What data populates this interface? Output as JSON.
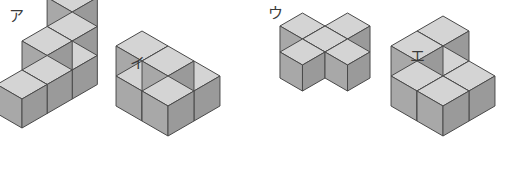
{
  "page": {
    "background_color": "#ffffff",
    "width": 515,
    "height": 184
  },
  "style": {
    "cube_top_color": "#d4d4d4",
    "cube_left_color": "#a8a8a8",
    "cube_right_color": "#9a9a9a",
    "cube_outline_color": "#4a4a4a",
    "label_color": "#3a3a3a"
  },
  "figures": [
    {
      "id": "figure-a",
      "label": "ア",
      "label_name": "figure-label-a",
      "description": "staircase of six cubes: three-high column at back, two-high in middle, one at front",
      "cube_size": 29,
      "origin_x": 22,
      "origin_y": 128,
      "cube_count": 6,
      "cubes": [
        {
          "x": 0,
          "y": 0,
          "z": 0
        },
        {
          "x": 1,
          "y": 0,
          "z": 0
        },
        {
          "x": 2,
          "y": 0,
          "z": 0
        },
        {
          "x": 1,
          "y": 0,
          "z": 1
        },
        {
          "x": 2,
          "y": 0,
          "z": 1
        },
        {
          "x": 2,
          "y": 0,
          "z": 2
        }
      ]
    },
    {
      "id": "figure-i",
      "label": "イ",
      "label_name": "figure-label-i",
      "description": "L-shaped arrangement of four cubes: two-by-one base with one cube stacked at back-left",
      "cube_size": 30,
      "origin_x": 168,
      "origin_y": 136,
      "cube_count": 4,
      "cubes": [
        {
          "x": 0,
          "y": 0,
          "z": 0
        },
        {
          "x": 0,
          "y": 1,
          "z": 0
        },
        {
          "x": 1,
          "y": 0,
          "z": 0
        },
        {
          "x": 0,
          "y": 1,
          "z": 1
        },
        {
          "x": 0,
          "y": 0,
          "z": 1
        }
      ]
    },
    {
      "id": "figure-u",
      "label": "ウ",
      "label_name": "figure-label-u",
      "description": "plus / cross shape of five cubes on one level, one center cube with four neighbours",
      "cube_size": 26,
      "origin_x": 325,
      "origin_y": 78,
      "cube_count": 5,
      "cubes": [
        {
          "x": 0,
          "y": 0,
          "z": 0
        },
        {
          "x": 1,
          "y": 0,
          "z": 0
        },
        {
          "x": -1,
          "y": 0,
          "z": 0
        },
        {
          "x": 0,
          "y": 1,
          "z": 0
        },
        {
          "x": 0,
          "y": -1,
          "z": 0
        }
      ]
    },
    {
      "id": "figure-e",
      "label": "エ",
      "label_name": "figure-label-e",
      "description": "two-by-two base with two cubes stacked on the back row",
      "cube_size": 30,
      "origin_x": 443,
      "origin_y": 136,
      "cube_count": 6,
      "cubes": [
        {
          "x": 0,
          "y": 0,
          "z": 0
        },
        {
          "x": 1,
          "y": 0,
          "z": 0
        },
        {
          "x": 0,
          "y": 1,
          "z": 0
        },
        {
          "x": 1,
          "y": 1,
          "z": 0
        },
        {
          "x": 0,
          "y": 1,
          "z": 1
        },
        {
          "x": 1,
          "y": 1,
          "z": 1
        }
      ]
    }
  ]
}
